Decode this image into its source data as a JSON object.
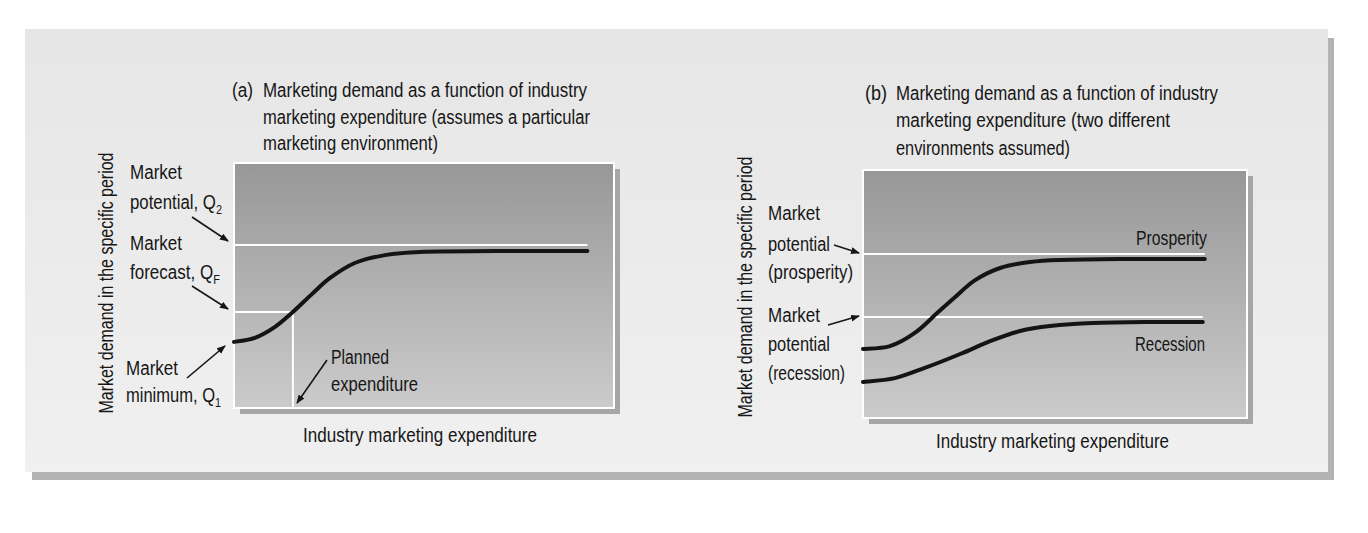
{
  "panel_a": {
    "label": "(a)",
    "title_lines": [
      "Marketing demand as a function of industry",
      "marketing expenditure (assumes a particular",
      "marketing environment)"
    ],
    "y_axis_label": "Market demand in the specific period",
    "x_axis_label": "Industry marketing expenditure",
    "annotations": {
      "market_potential": {
        "line1": "Market",
        "line2": "potential, Q",
        "sub": "2"
      },
      "market_forecast": {
        "line1": "Market",
        "line2": "forecast, Q",
        "sub": "F"
      },
      "market_minimum": {
        "line1": "Market",
        "line2": "minimum, Q",
        "sub": "1"
      },
      "planned_expenditure": {
        "line1": "Planned",
        "line2": "expenditure"
      }
    }
  },
  "panel_b": {
    "label": "(b)",
    "title_lines": [
      "Marketing demand as a function of industry",
      "marketing expenditure (two different",
      "environments assumed)"
    ],
    "y_axis_label": "Market demand in the specific period",
    "x_axis_label": "Industry marketing expenditure",
    "annotations": {
      "potential_prosperity": {
        "line1": "Market",
        "line2": "potential",
        "line3": "(prosperity)"
      },
      "potential_recession": {
        "line1": "Market",
        "line2": "potential",
        "line3": "(recession)"
      },
      "prosperity_label": "Prosperity",
      "recession_label": "Recession"
    }
  },
  "colors": {
    "panel_background": "#ececec",
    "plot_fill_top": "#979797",
    "plot_fill_bottom": "#cbcbcb",
    "curve": "#141414",
    "reference_line": "#ffffff",
    "shadow": "#b3b3b3"
  },
  "chart_data": [
    {
      "type": "line",
      "title": "(a) Marketing demand as a function of industry marketing expenditure (assumes a particular marketing environment)",
      "xlabel": "Industry marketing expenditure",
      "ylabel": "Market demand in the specific period",
      "xlim": [
        0,
        100
      ],
      "ylim": [
        0,
        100
      ],
      "grid": false,
      "legend": null,
      "series": [
        {
          "name": "Market demand",
          "x": [
            0,
            5.5,
            10.8,
            15.5,
            20.5,
            25.3,
            31.8,
            39.7,
            48.9,
            70,
            93
          ],
          "y": [
            27,
            28.6,
            33.1,
            39.2,
            46.5,
            53.1,
            59.2,
            62.4,
            63.7,
            64.1,
            64.1
          ]
        }
      ],
      "reference_lines": [
        {
          "id": "market-potential-q2",
          "name": "Market potential, Q2",
          "orientation": "horizontal",
          "y": 66.5,
          "x_range": [
            0,
            93
          ]
        },
        {
          "id": "market-forecast-qf",
          "name": "Market forecast, QF",
          "orientation": "horizontal",
          "y": 39.2,
          "x_range": [
            0,
            15.5
          ]
        },
        {
          "id": "planned-expenditure",
          "name": "Planned expenditure",
          "orientation": "vertical",
          "x": 15.5,
          "y_range": [
            0,
            39.2
          ]
        }
      ],
      "annotations": [
        "Market potential, Q2",
        "Market forecast, QF",
        "Market minimum, Q1",
        "Planned expenditure"
      ]
    },
    {
      "type": "line",
      "title": "(b) Marketing demand as a function of industry marketing expenditure (two different environments assumed)",
      "xlabel": "Industry marketing expenditure",
      "ylabel": "Market demand in the specific period",
      "xlim": [
        0,
        100
      ],
      "ylim": [
        0,
        100
      ],
      "grid": false,
      "legend": null,
      "series": [
        {
          "name": "Prosperity",
          "x": [
            0,
            7,
            13.5,
            19.3,
            24,
            29.2,
            35.7,
            43.5,
            51.3,
            67,
            89
          ],
          "y": [
            27.8,
            29,
            34.3,
            42.3,
            48.8,
            55.6,
            60.5,
            62.9,
            63.7,
            64.1,
            64.1
          ]
        },
        {
          "name": "Recession",
          "x": [
            0,
            8.3,
            16.1,
            25.3,
            33.1,
            40.9,
            48.7,
            59.9,
            74.7,
            88.5
          ],
          "y": [
            14.5,
            16.1,
            20.2,
            25.8,
            31,
            35.1,
            37.1,
            38.3,
            38.7,
            38.7
          ]
        }
      ],
      "reference_lines": [
        {
          "id": "market-potential-prosperity",
          "name": "Market potential (prosperity)",
          "orientation": "horizontal",
          "y": 66.1,
          "x_range": [
            0,
            89
          ]
        },
        {
          "id": "market-potential-recession",
          "name": "Market potential (recession)",
          "orientation": "horizontal",
          "y": 40.7,
          "x_range": [
            0,
            88.5
          ]
        }
      ],
      "annotations": [
        "Market potential (prosperity)",
        "Market potential (recession)",
        "Prosperity",
        "Recession"
      ]
    }
  ]
}
